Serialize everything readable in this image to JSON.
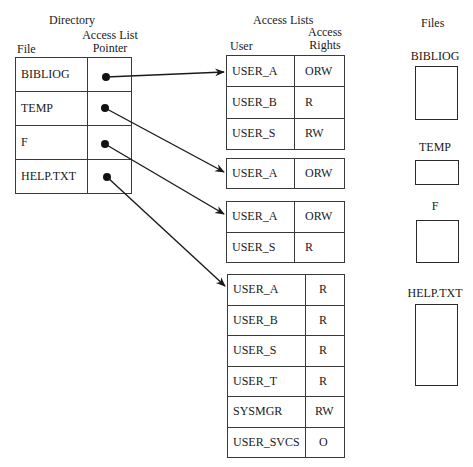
{
  "directory": {
    "title": "Directory",
    "col_file": "File",
    "col_pointer_line1": "Access List",
    "col_pointer_line2": "Pointer",
    "rows": [
      {
        "file": "BIBLIOG"
      },
      {
        "file": "TEMP"
      },
      {
        "file": "F"
      },
      {
        "file": "HELP.TXT"
      }
    ]
  },
  "access_lists": {
    "title": "Access Lists",
    "col_user": "User",
    "col_rights_line1": "Access",
    "col_rights_line2": "Rights",
    "lists": [
      {
        "entries": [
          {
            "user": "USER_A",
            "rights": "ORW"
          },
          {
            "user": "USER_B",
            "rights": "R"
          },
          {
            "user": "USER_S",
            "rights": "RW"
          }
        ]
      },
      {
        "entries": [
          {
            "user": "USER_A",
            "rights": "ORW"
          }
        ]
      },
      {
        "entries": [
          {
            "user": "USER_A",
            "rights": "ORW"
          },
          {
            "user": "USER_S",
            "rights": "R"
          }
        ]
      },
      {
        "entries": [
          {
            "user": "USER_A",
            "rights": "R"
          },
          {
            "user": "USER_B",
            "rights": "R"
          },
          {
            "user": "USER_S",
            "rights": "R"
          },
          {
            "user": "USER_T",
            "rights": "R"
          },
          {
            "user": "SYSMGR",
            "rights": "RW"
          },
          {
            "user": "USER_SVCS",
            "rights": "O"
          }
        ]
      }
    ]
  },
  "files": {
    "title": "Files",
    "items": [
      {
        "label": "BIBLIOG"
      },
      {
        "label": "TEMP"
      },
      {
        "label": "F"
      },
      {
        "label": "HELP.TXT"
      }
    ]
  },
  "pointers": [
    {
      "from": "BIBLIOG",
      "to_list": 0
    },
    {
      "from": "TEMP",
      "to_list": 1
    },
    {
      "from": "F",
      "to_list": 2
    },
    {
      "from": "HELP.TXT",
      "to_list": 3
    }
  ],
  "colors": {
    "line": "#1a1a1a",
    "background": "#ffffff"
  }
}
